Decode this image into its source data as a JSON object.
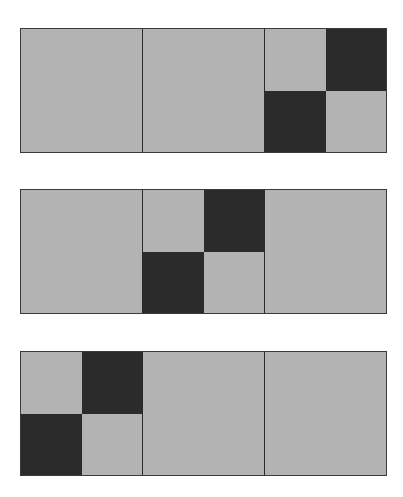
{
  "colors": {
    "light": "#b3b3b3",
    "dark": "#2b2b2b",
    "border": "#2a2a2a",
    "background": "#ffffff"
  },
  "strips": [
    {
      "top": 28,
      "checker_cell_index": 2,
      "cells": [
        "plain",
        "plain",
        "checker"
      ]
    },
    {
      "top": 189,
      "checker_cell_index": 1,
      "cells": [
        "plain",
        "checker",
        "plain"
      ]
    },
    {
      "top": 351,
      "checker_cell_index": 0,
      "cells": [
        "checker",
        "plain",
        "plain"
      ]
    }
  ],
  "checker_pattern": {
    "top_left": "light",
    "top_right": "dark",
    "bottom_left": "dark",
    "bottom_right": "light"
  }
}
